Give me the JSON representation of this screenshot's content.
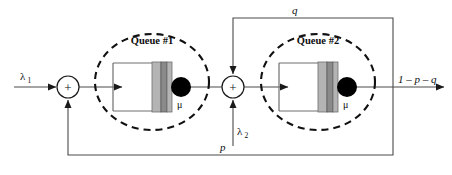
{
  "diagram": {
    "type": "queueing-network",
    "canvas": {
      "width": 452,
      "height": 175,
      "background": "#ffffff"
    },
    "colors": {
      "wire": "#4a4a4a",
      "ellipse": "#111111",
      "server_dot": "#000000",
      "bar_light": "#b4b4b4",
      "bar_dark": "#8a8a8a",
      "box_outline": "#6e6e6e",
      "text": "#0d0d0d"
    },
    "labels": {
      "arrival_1": "λ",
      "arrival_1_sub": "1",
      "arrival_2": "λ",
      "arrival_2_sub": "2",
      "queue_1": "Queue #1",
      "queue_2": "Queue #2",
      "service_rate_1": "μ",
      "service_rate_2": "μ",
      "feedback_top": "q",
      "feedback_bottom": "p",
      "departure": "1 – p – q",
      "adder_1": "+",
      "adder_2": "+"
    },
    "nodes": [
      {
        "id": "adder-1",
        "kind": "summing-junction",
        "label": "+",
        "cx": 68,
        "cy": 87,
        "r": 11
      },
      {
        "id": "queue-1",
        "kind": "queue-station",
        "label": "Queue #1",
        "cx": 152,
        "cy": 82,
        "rx": 57,
        "ry": 48
      },
      {
        "id": "adder-2",
        "kind": "summing-junction",
        "label": "+",
        "cx": 233,
        "cy": 87,
        "r": 11
      },
      {
        "id": "queue-2",
        "kind": "queue-station",
        "label": "Queue #2",
        "cx": 318,
        "cy": 82,
        "rx": 57,
        "ry": 48
      }
    ],
    "flows": [
      {
        "id": "arrival-1",
        "label": "λ1",
        "from": "external",
        "to": "adder-1"
      },
      {
        "id": "adder1-to-queue1",
        "from": "adder-1",
        "to": "queue-1"
      },
      {
        "id": "queue1-to-adder2",
        "from": "queue-1",
        "to": "adder-2"
      },
      {
        "id": "arrival-2",
        "label": "λ2",
        "from": "external",
        "to": "adder-2"
      },
      {
        "id": "adder2-to-queue2",
        "from": "adder-2",
        "to": "queue-2"
      },
      {
        "id": "departure",
        "label": "1 – p – q",
        "from": "queue-2",
        "to": "external"
      },
      {
        "id": "feedback-q",
        "label": "q",
        "from": "queue-2-output",
        "to": "adder-2"
      },
      {
        "id": "feedback-p",
        "label": "p",
        "from": "queue-2-output",
        "to": "adder-1"
      }
    ]
  }
}
